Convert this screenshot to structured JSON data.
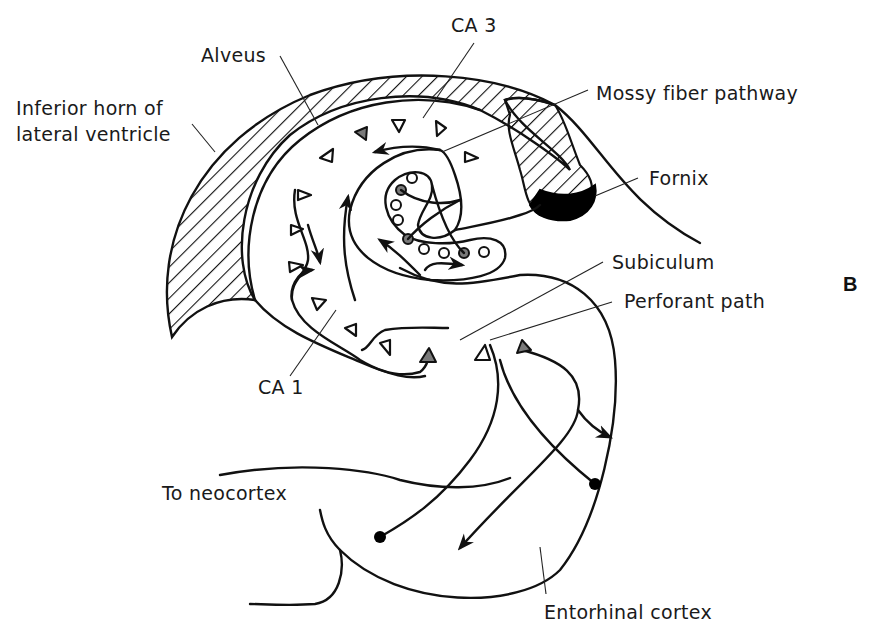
{
  "figure": {
    "panel_label": "B",
    "colors": {
      "line": "#111111",
      "background": "#ffffff",
      "gray_neuron": "#7a7a7a",
      "fornix_fill": "#000000"
    }
  },
  "labels": {
    "alveus": "Alveus",
    "ca3": "CA 3",
    "inferior_horn": [
      "Inferior horn of",
      "lateral ventricle"
    ],
    "mossy_fiber": "Mossy fiber pathway",
    "fornix": "Fornix",
    "subiculum": "Subiculum",
    "perforant_path": "Perforant path",
    "ca1": "CA 1",
    "to_neocortex": "To neocortex",
    "entorhinal_cortex": "Entorhinal cortex"
  },
  "legend_symbols": {
    "open_triangle": "pyramidal cell",
    "gray_triangle": "pyramidal cell (highlighted)",
    "open_circle": "granule cell",
    "gray_circle": "granule cell (highlighted)",
    "black_dot": "entorhinal neuron"
  }
}
